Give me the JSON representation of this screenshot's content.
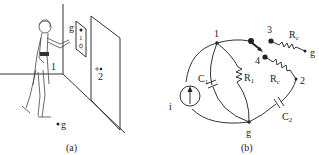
{
  "figure": {
    "panel_a": {
      "caption": "(a)",
      "labels": {
        "node_1": "1",
        "node_2": "2",
        "ground_panel": "g",
        "ground_floor": "g"
      }
    },
    "panel_b": {
      "caption": "(b)",
      "labels": {
        "node_1": "1",
        "node_2": "2",
        "node_3": "3",
        "node_4": "4",
        "ground": "g",
        "ground_right": "g",
        "source": "i",
        "C1": "C",
        "C1_sub": "1",
        "R1": "R",
        "R1_sub": "1",
        "C2": "C",
        "C2_sub": "2",
        "Rc_top": "R",
        "Rc_top_sub": "c",
        "Rc_mid": "R",
        "Rc_mid_sub": "c"
      }
    }
  }
}
